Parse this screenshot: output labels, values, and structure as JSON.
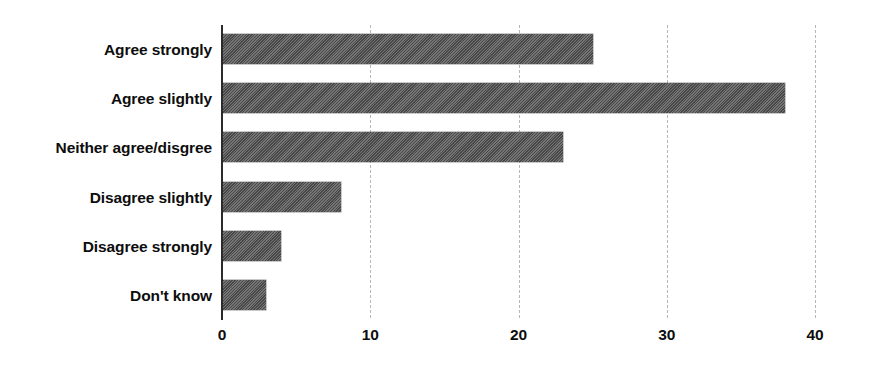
{
  "chart_data": {
    "type": "bar",
    "orientation": "horizontal",
    "title": "",
    "subtitle": "",
    "xlabel": "",
    "ylabel": "",
    "categories": [
      "Agree strongly",
      "Agree slightly",
      "Neither agree/disgree",
      "Disagree slightly",
      "Disagree strongly",
      "Don't know"
    ],
    "values": [
      25,
      38,
      23,
      8,
      4,
      3
    ],
    "xlim": [
      0,
      40
    ],
    "xticks": [
      0,
      10,
      20,
      30,
      40
    ],
    "xtick_labels": [
      "0",
      "10",
      "20",
      "30",
      "40"
    ],
    "grid": true,
    "grid_axis": "x",
    "legend": false,
    "bar_color": "#5a5a5a",
    "bar_pattern": "diagonal-hatch",
    "axis_color": "#2b2b2b",
    "gridline_color": "#b8b8b8",
    "background_color": "#ffffff",
    "text_color": "#0d0d0d"
  }
}
